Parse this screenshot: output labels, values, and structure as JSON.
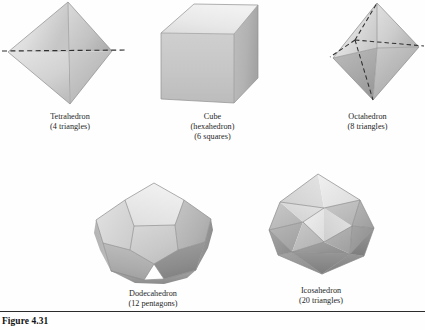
{
  "figure": {
    "number_label": "Figure 4.31",
    "solids": [
      {
        "id": "tetrahedron",
        "name": "Tetrahedron",
        "detail": "(4 triangles)",
        "icon": "tetrahedron-icon",
        "faces": 4,
        "face_shape": "triangles"
      },
      {
        "id": "cube",
        "name": "Cube",
        "alt_name": "(hexahedron)",
        "detail": "(6 squares)",
        "icon": "cube-icon",
        "faces": 6,
        "face_shape": "squares"
      },
      {
        "id": "octahedron",
        "name": "Octahedron",
        "detail": "(8 triangles)",
        "icon": "octahedron-icon",
        "faces": 8,
        "face_shape": "triangles"
      },
      {
        "id": "dodecahedron",
        "name": "Dodecahedron",
        "detail": "(12 pentagons)",
        "icon": "dodecahedron-icon",
        "faces": 12,
        "face_shape": "pentagons"
      },
      {
        "id": "icosahedron",
        "name": "Icosahedron",
        "detail": "(20 triangles)",
        "icon": "icosahedron-icon",
        "faces": 20,
        "face_shape": "triangles"
      }
    ]
  },
  "palette": {
    "page_background": "#fefefe",
    "face_lightest": "#e9e9e9",
    "face_light": "#dcdcdc",
    "face_mid": "#c8c8c8",
    "face_dark": "#b0b0b0",
    "face_darker": "#9a9a9a",
    "face_darkest": "#828282",
    "hidden_edge": "#2f2f2f",
    "text": "#262626",
    "rule": "#2b2b2b"
  }
}
